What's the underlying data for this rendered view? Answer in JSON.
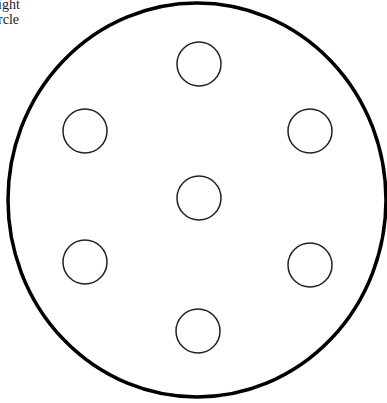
{
  "caption": {
    "line1": "ight",
    "line2": "rcle"
  },
  "diagram": {
    "outer_circle": {
      "cx": 197,
      "cy": 200,
      "rx": 189,
      "ry": 197,
      "stroke": "#000000",
      "stroke_width": 3.5
    },
    "small_circles": [
      {
        "name": "top",
        "cx": 199,
        "cy": 64,
        "r": 22
      },
      {
        "name": "upper-left",
        "cx": 85,
        "cy": 131,
        "r": 22
      },
      {
        "name": "upper-right",
        "cx": 310,
        "cy": 131,
        "r": 22
      },
      {
        "name": "center",
        "cx": 199,
        "cy": 198,
        "r": 22
      },
      {
        "name": "lower-left",
        "cx": 85,
        "cy": 262,
        "r": 22
      },
      {
        "name": "lower-right",
        "cx": 310,
        "cy": 265,
        "r": 22
      },
      {
        "name": "bottom",
        "cx": 198,
        "cy": 331,
        "r": 22
      }
    ],
    "small_stroke": "#222222",
    "small_stroke_width": 1.5
  }
}
